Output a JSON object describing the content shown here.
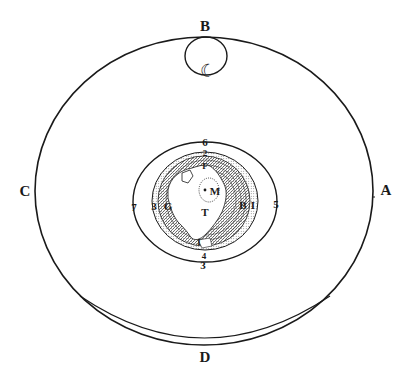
{
  "diagram": {
    "colors": {
      "ink": "#1a1a1a",
      "paper": "#ffffff",
      "hatch": "#3a3a3a"
    },
    "outer_orbit_labels": {
      "top": "B",
      "right": "A",
      "bottom": "D",
      "left": "C"
    },
    "moon_symbol": "☾",
    "inner_orbit_labels": {
      "top": "6",
      "right": "5",
      "bottom": "3",
      "bottom_inner": "4",
      "left": "7"
    },
    "earth_labels": {
      "center_dot": "M",
      "below_center": "T",
      "top": "F",
      "top_outer": "2",
      "left_outer": "3",
      "left_inner": "G",
      "right_inner": "B",
      "right_outer": "I",
      "bottom": "I"
    }
  }
}
